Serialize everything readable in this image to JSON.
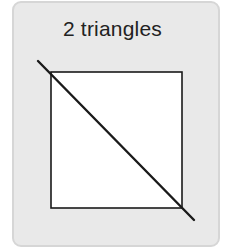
{
  "card": {
    "title": "2 triangles",
    "background": "#e9e9e9",
    "border": "#d6d6d6"
  },
  "figure": {
    "square": {
      "x": 51,
      "y": 72,
      "width": 131,
      "height": 136,
      "fill": "#ffffff",
      "stroke": "#1a1a1a"
    },
    "diagonal": {
      "x1": 38,
      "y1": 61,
      "x2": 194,
      "y2": 220,
      "stroke": "#1a1a1a"
    }
  }
}
